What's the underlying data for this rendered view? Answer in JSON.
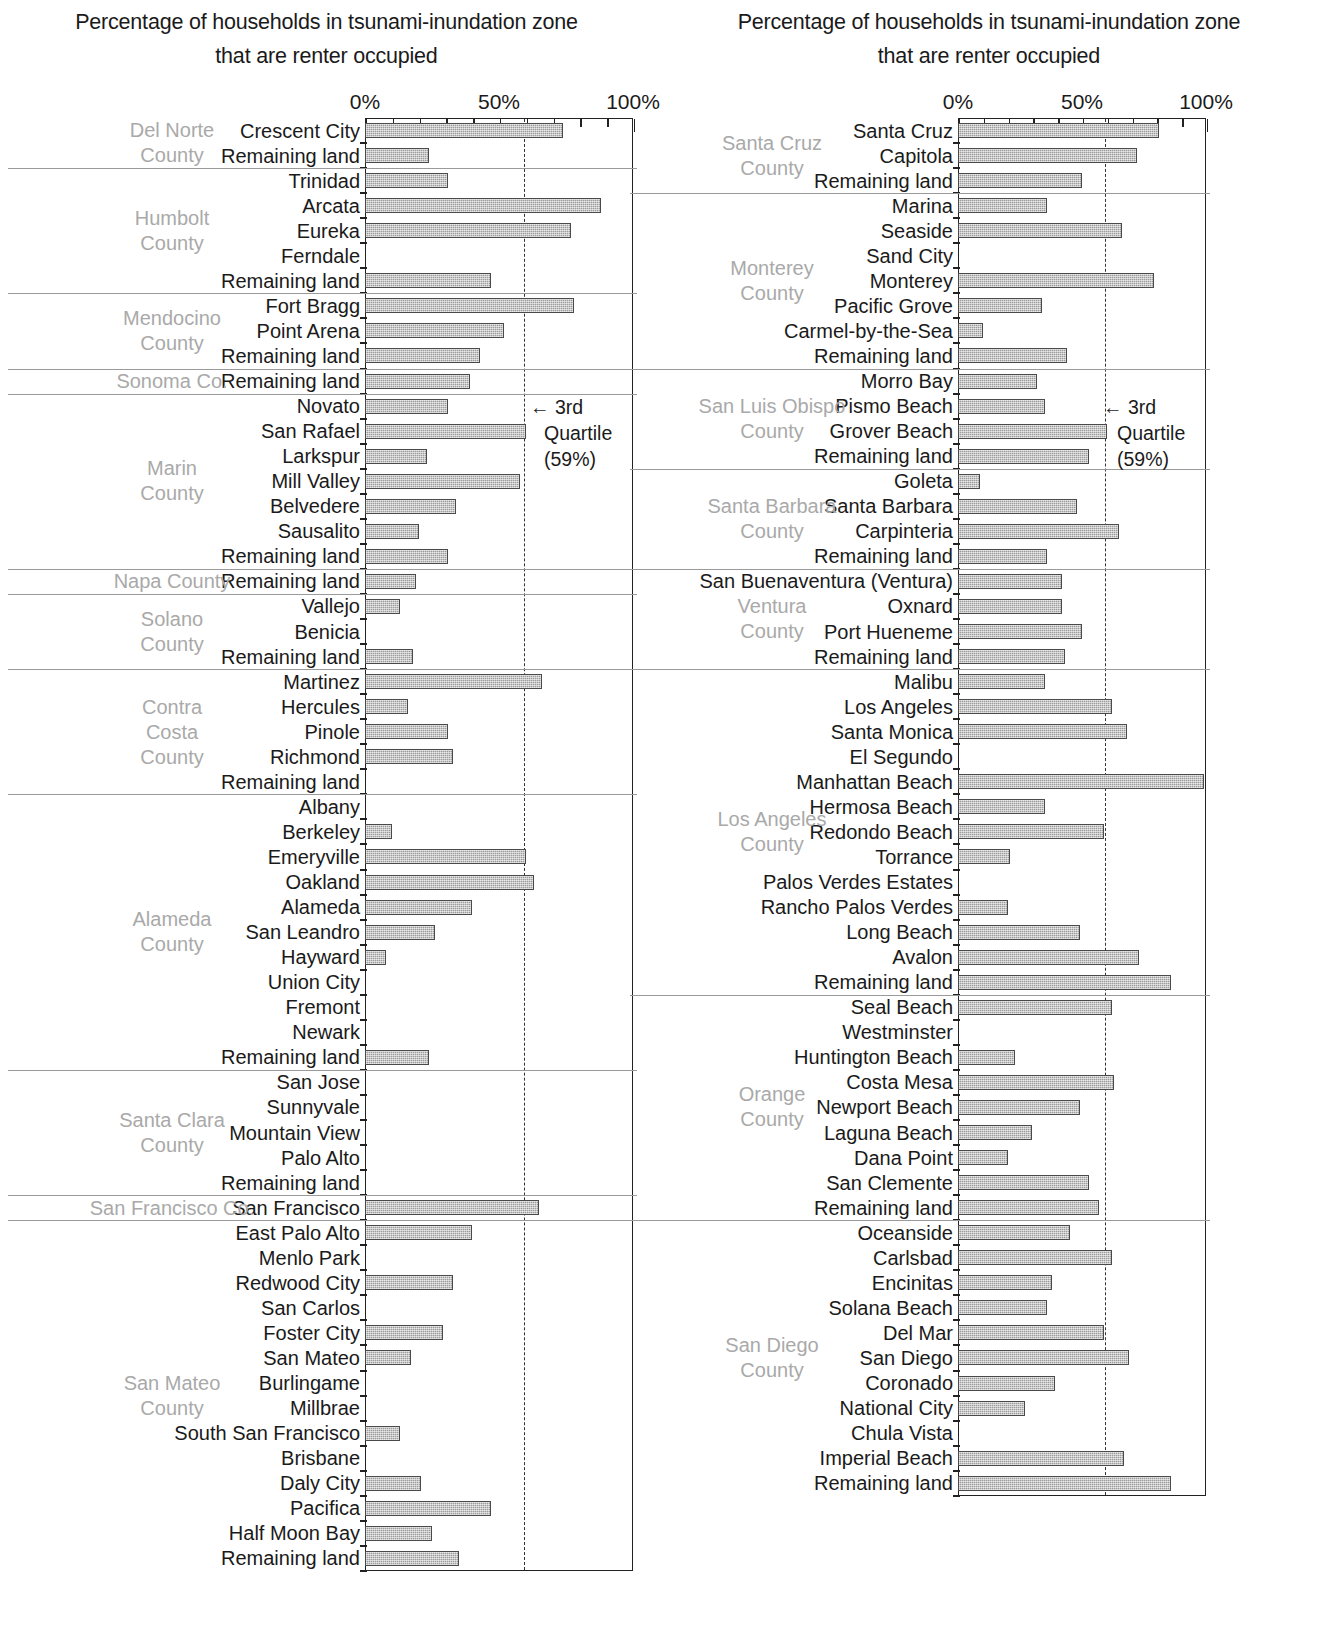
{
  "figure": {
    "title_line1": "Percentage of households in tsunami-inundation zone",
    "title_line2": "that are renter occupied",
    "axis_ticks": [
      "0%",
      "50%",
      "100%"
    ],
    "quartile_arrow": "← 3rd",
    "quartile_word": "Quartile",
    "quartile_value": "(59%)"
  },
  "chart_data": {
    "type": "bar",
    "orientation": "horizontal",
    "title": "Percentage of households in tsunami-inundation zone that are renter occupied",
    "xlabel": "",
    "ylabel": "",
    "xlim": [
      0,
      100
    ],
    "xticks": [
      0,
      50,
      100
    ],
    "xtick_labels": [
      "0%",
      "50%",
      "100%"
    ],
    "minor_tick_interval": 10,
    "grid": false,
    "legend": "none",
    "annotations": [
      {
        "text": "← 3rd Quartile (59%)",
        "type": "reference-line-label",
        "value": 59
      }
    ],
    "reference_line": {
      "label": "3rd Quartile",
      "value": 59,
      "style": "dashed"
    },
    "panels": [
      {
        "id": "left",
        "groups": [
          {
            "county": "Del Norte County",
            "county_lines": [
              "Del Norte",
              "County"
            ],
            "rows": [
              {
                "label": "Crescent City",
                "value": 74
              },
              {
                "label": "Remaining land",
                "value": 24
              }
            ]
          },
          {
            "county": "Humbolt County",
            "county_lines": [
              "Humbolt",
              "County"
            ],
            "rows": [
              {
                "label": "Trinidad",
                "value": 31
              },
              {
                "label": "Arcata",
                "value": 88
              },
              {
                "label": "Eureka",
                "value": 77
              },
              {
                "label": "Ferndale",
                "value": 0
              },
              {
                "label": "Remaining land",
                "value": 47
              }
            ]
          },
          {
            "county": "Mendocino County",
            "county_lines": [
              "Mendocino",
              "County"
            ],
            "rows": [
              {
                "label": "Fort Bragg",
                "value": 78
              },
              {
                "label": "Point Arena",
                "value": 52
              },
              {
                "label": "Remaining land",
                "value": 43
              }
            ]
          },
          {
            "county": "Sonoma Co.",
            "county_lines": [
              "Sonoma Co."
            ],
            "rows": [
              {
                "label": "Remaining land",
                "value": 39
              }
            ]
          },
          {
            "county": "Marin County",
            "county_lines": [
              "Marin",
              "County"
            ],
            "rows": [
              {
                "label": "Novato",
                "value": 31
              },
              {
                "label": "San Rafael",
                "value": 60
              },
              {
                "label": "Larkspur",
                "value": 23
              },
              {
                "label": "Mill Valley",
                "value": 58
              },
              {
                "label": "Belvedere",
                "value": 34
              },
              {
                "label": "Sausalito",
                "value": 20
              },
              {
                "label": "Remaining land",
                "value": 31
              }
            ]
          },
          {
            "county": "Napa County",
            "county_lines": [
              "Napa County"
            ],
            "rows": [
              {
                "label": "Remaining land",
                "value": 19
              }
            ]
          },
          {
            "county": "Solano County",
            "county_lines": [
              "Solano",
              "County"
            ],
            "rows": [
              {
                "label": "Vallejo",
                "value": 13
              },
              {
                "label": "Benicia",
                "value": 0
              },
              {
                "label": "Remaining land",
                "value": 18
              }
            ]
          },
          {
            "county": "Contra Costa County",
            "county_lines": [
              "Contra",
              "Costa",
              "County"
            ],
            "rows": [
              {
                "label": "Martinez",
                "value": 66
              },
              {
                "label": "Hercules",
                "value": 16
              },
              {
                "label": "Pinole",
                "value": 31
              },
              {
                "label": "Richmond",
                "value": 33
              },
              {
                "label": "Remaining land",
                "value": 0
              }
            ]
          },
          {
            "county": "Alameda County",
            "county_lines": [
              "Alameda",
              "County"
            ],
            "rows": [
              {
                "label": "Albany",
                "value": 0
              },
              {
                "label": "Berkeley",
                "value": 10
              },
              {
                "label": "Emeryville",
                "value": 60
              },
              {
                "label": "Oakland",
                "value": 63
              },
              {
                "label": "Alameda",
                "value": 40
              },
              {
                "label": "San Leandro",
                "value": 26
              },
              {
                "label": "Hayward",
                "value": 8
              },
              {
                "label": "Union City",
                "value": 0
              },
              {
                "label": "Fremont",
                "value": 0
              },
              {
                "label": "Newark",
                "value": 0
              },
              {
                "label": "Remaining land",
                "value": 24
              }
            ]
          },
          {
            "county": "Santa Clara County",
            "county_lines": [
              "Santa Clara",
              "County"
            ],
            "rows": [
              {
                "label": "San Jose",
                "value": 0
              },
              {
                "label": "Sunnyvale",
                "value": 0
              },
              {
                "label": "Mountain View",
                "value": 0
              },
              {
                "label": "Palo Alto",
                "value": 0
              },
              {
                "label": "Remaining land",
                "value": 0
              }
            ]
          },
          {
            "county": "San Francisco Co.",
            "county_lines": [
              "San Francisco Co."
            ],
            "rows": [
              {
                "label": "San Francisco",
                "value": 65
              }
            ]
          },
          {
            "county": "San Mateo County",
            "county_lines": [
              "San Mateo",
              "County"
            ],
            "rows": [
              {
                "label": "East Palo Alto",
                "value": 40
              },
              {
                "label": "Menlo Park",
                "value": 0
              },
              {
                "label": "Redwood City",
                "value": 33
              },
              {
                "label": "San Carlos",
                "value": 0
              },
              {
                "label": "Foster City",
                "value": 29
              },
              {
                "label": "San Mateo",
                "value": 17
              },
              {
                "label": "Burlingame",
                "value": 0
              },
              {
                "label": "Millbrae",
                "value": 0
              },
              {
                "label": "South San Francisco",
                "value": 13
              },
              {
                "label": "Brisbane",
                "value": 0
              },
              {
                "label": "Daly City",
                "value": 21
              },
              {
                "label": "Pacifica",
                "value": 47
              },
              {
                "label": "Half Moon Bay",
                "value": 25
              },
              {
                "label": "Remaining land",
                "value": 35
              }
            ]
          }
        ]
      },
      {
        "id": "right",
        "groups": [
          {
            "county": "Santa Cruz County",
            "county_lines": [
              "Santa Cruz",
              "County"
            ],
            "rows": [
              {
                "label": "Santa Cruz",
                "value": 81
              },
              {
                "label": "Capitola",
                "value": 72
              },
              {
                "label": "Remaining land",
                "value": 50
              }
            ]
          },
          {
            "county": "Monterey County",
            "county_lines": [
              "Monterey",
              "County"
            ],
            "rows": [
              {
                "label": "Marina",
                "value": 36
              },
              {
                "label": "Seaside",
                "value": 66
              },
              {
                "label": "Sand City",
                "value": 0
              },
              {
                "label": "Monterey",
                "value": 79
              },
              {
                "label": "Pacific Grove",
                "value": 34
              },
              {
                "label": "Carmel-by-the-Sea",
                "value": 10
              },
              {
                "label": "Remaining land",
                "value": 44
              }
            ]
          },
          {
            "county": "San Luis Obispo County",
            "county_lines": [
              "San Luis Obispo",
              "County"
            ],
            "rows": [
              {
                "label": "Morro Bay",
                "value": 32
              },
              {
                "label": "Pismo Beach",
                "value": 35
              },
              {
                "label": "Grover Beach",
                "value": 60
              },
              {
                "label": "Remaining land",
                "value": 53
              }
            ]
          },
          {
            "county": "Santa Barbara County",
            "county_lines": [
              "Santa Barbara",
              "County"
            ],
            "rows": [
              {
                "label": "Goleta",
                "value": 9
              },
              {
                "label": "Santa Barbara",
                "value": 48
              },
              {
                "label": "Carpinteria",
                "value": 65
              },
              {
                "label": "Remaining land",
                "value": 36
              }
            ]
          },
          {
            "county": "Ventura County",
            "county_lines": [
              "Ventura",
              "County"
            ],
            "rows": [
              {
                "label": "San Buenaventura (Ventura)",
                "value": 42
              },
              {
                "label": "Oxnard",
                "value": 42
              },
              {
                "label": "Port Hueneme",
                "value": 50
              },
              {
                "label": "Remaining land",
                "value": 43
              }
            ]
          },
          {
            "county": "Los Angeles County",
            "county_lines": [
              "Los Angeles",
              "County"
            ],
            "rows": [
              {
                "label": "Malibu",
                "value": 35
              },
              {
                "label": "Los Angeles",
                "value": 62
              },
              {
                "label": "Santa Monica",
                "value": 68
              },
              {
                "label": "El Segundo",
                "value": 0
              },
              {
                "label": "Manhattan Beach",
                "value": 99
              },
              {
                "label": "Hermosa Beach",
                "value": 35
              },
              {
                "label": "Redondo Beach",
                "value": 59
              },
              {
                "label": "Torrance",
                "value": 21
              },
              {
                "label": "Palos Verdes Estates",
                "value": 0
              },
              {
                "label": "Rancho Palos Verdes",
                "value": 20
              },
              {
                "label": "Long Beach",
                "value": 49
              },
              {
                "label": "Avalon",
                "value": 73
              },
              {
                "label": "Remaining land",
                "value": 86
              }
            ]
          },
          {
            "county": "Orange County",
            "county_lines": [
              "Orange",
              "County"
            ],
            "rows": [
              {
                "label": "Seal Beach",
                "value": 62
              },
              {
                "label": "Westminster",
                "value": 0
              },
              {
                "label": "Huntington Beach",
                "value": 23
              },
              {
                "label": "Costa Mesa",
                "value": 63
              },
              {
                "label": "Newport Beach",
                "value": 49
              },
              {
                "label": "Laguna Beach",
                "value": 30
              },
              {
                "label": "Dana Point",
                "value": 20
              },
              {
                "label": "San Clemente",
                "value": 53
              },
              {
                "label": "Remaining land",
                "value": 57
              }
            ]
          },
          {
            "county": "San Diego County",
            "county_lines": [
              "San Diego",
              "County"
            ],
            "rows": [
              {
                "label": "Oceanside",
                "value": 45
              },
              {
                "label": "Carlsbad",
                "value": 62
              },
              {
                "label": "Encinitas",
                "value": 38
              },
              {
                "label": "Solana Beach",
                "value": 36
              },
              {
                "label": "Del Mar",
                "value": 59
              },
              {
                "label": "San Diego",
                "value": 69
              },
              {
                "label": "Coronado",
                "value": 39
              },
              {
                "label": "National City",
                "value": 27
              },
              {
                "label": "Chula Vista",
                "value": 0
              },
              {
                "label": "Imperial Beach",
                "value": 67
              },
              {
                "label": "Remaining land",
                "value": 86
              }
            ]
          }
        ]
      }
    ]
  }
}
